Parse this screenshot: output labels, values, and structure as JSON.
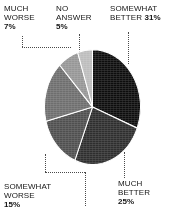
{
  "chart_data": {
    "type": "pie",
    "title": "",
    "subtitle": "",
    "xlabel": "",
    "ylabel": "",
    "legend_position": "callout-labels",
    "grid": false,
    "units": "percent",
    "start_angle_deg": 0,
    "direction": "clockwise",
    "categories": [
      "SOMEWHAT BETTER",
      "MUCH BETTER",
      "SOMEWHAT WORSE",
      "SAME",
      "MUCH WORSE",
      "NO ANSWER"
    ],
    "values": [
      31,
      25,
      15,
      17,
      7,
      5
    ],
    "colors": [
      "#0d0d0d",
      "#2e2e2e",
      "#4f4f4f",
      "#6e6e6e",
      "#969696",
      "#bdbdbd"
    ],
    "labeled_slices": [
      {
        "label": "SOMEWHAT BETTER",
        "value": 31,
        "value_text": "31%",
        "color": "#0d0d0d"
      },
      {
        "label": "MUCH BETTER",
        "value": 25,
        "value_text": "25%",
        "color": "#2e2e2e"
      },
      {
        "label": "SOMEWHAT WORSE",
        "value": 15,
        "value_text": "15%",
        "color": "#4f4f4f"
      },
      {
        "label": "MUCH WORSE",
        "value": 7,
        "value_text": "7%",
        "color": "#969696"
      },
      {
        "label": "NO ANSWER",
        "value": 5,
        "value_text": "5%",
        "color": "#bdbdbd"
      }
    ]
  },
  "callouts": {
    "much_worse": {
      "line1": "MUCH",
      "line2": "WORSE",
      "percent": "7%"
    },
    "no_answer": {
      "line1": "NO",
      "line2": "ANSWER",
      "percent": "5%"
    },
    "somewhat_better": {
      "line1": "SOMEWHAT",
      "line2": "BETTER",
      "percent": "31%"
    },
    "somewhat_worse": {
      "line1": "SOMEWHAT",
      "line2": "WORSE",
      "percent": "15%"
    },
    "much_better": {
      "line1": "MUCH",
      "line2": "BETTER",
      "percent": "25%"
    }
  },
  "style": {
    "background": "#ffffff",
    "text_color": "#151515",
    "leader_color": "#4a4a4a"
  }
}
